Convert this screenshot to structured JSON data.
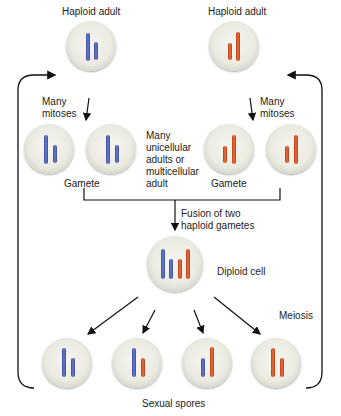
{
  "diagram": {
    "labels": {
      "haploid_adult_left": "Haploid adult",
      "haploid_adult_right": "Haploid adult",
      "many_mitoses_left": "Many\nmitoses",
      "many_mitoses_right": "Many\nmitoses",
      "many_adults": "Many\nunicellular\nadults or\nmulticellular\nadult",
      "gamete_left": "Gamete",
      "gamete_right": "Gamete",
      "fusion": "Fusion of two\nhaploid gametes",
      "diploid_cell": "Diploid cell",
      "meiosis": "Meiosis",
      "sexual_spores": "Sexual spores"
    },
    "colors": {
      "parent_a_chromosome": "#4a5bb0",
      "parent_b_chromosome": "#d9582a",
      "cell_fill": "#ecebe2",
      "arrow": "#111111"
    },
    "nodes": [
      {
        "id": "haploid-adult-a",
        "chromosomes": [
          "blue-long",
          "blue-short"
        ]
      },
      {
        "id": "haploid-adult-b",
        "chromosomes": [
          "orange-short",
          "orange-long"
        ]
      },
      {
        "id": "gamete-a-1",
        "chromosomes": [
          "blue-long",
          "blue-short"
        ]
      },
      {
        "id": "gamete-a-2",
        "chromosomes": [
          "blue-long",
          "blue-short"
        ]
      },
      {
        "id": "gamete-b-1",
        "chromosomes": [
          "orange-short",
          "orange-long"
        ]
      },
      {
        "id": "gamete-b-2",
        "chromosomes": [
          "orange-short",
          "orange-long"
        ]
      },
      {
        "id": "diploid-cell",
        "chromosomes": [
          "blue-long",
          "blue-short",
          "orange-short",
          "orange-long"
        ]
      },
      {
        "id": "spore-1",
        "chromosomes": [
          "blue-long",
          "blue-short"
        ]
      },
      {
        "id": "spore-2",
        "chromosomes": [
          "blue-long",
          "orange-short"
        ]
      },
      {
        "id": "spore-3",
        "chromosomes": [
          "blue-short",
          "orange-long"
        ]
      },
      {
        "id": "spore-4",
        "chromosomes": [
          "orange-long",
          "orange-short"
        ]
      }
    ]
  }
}
